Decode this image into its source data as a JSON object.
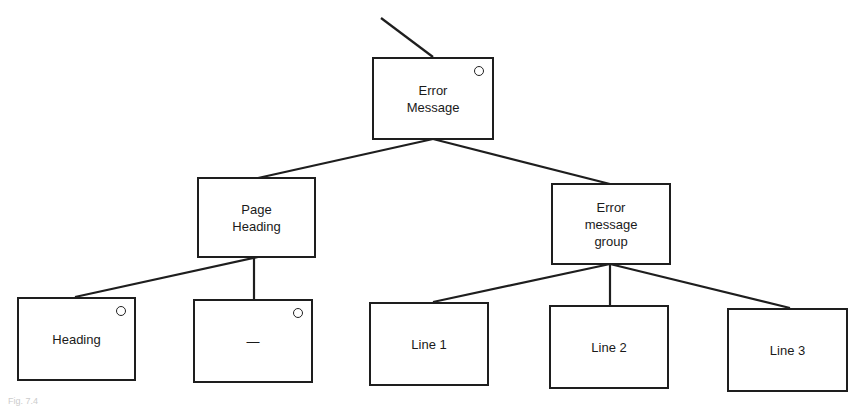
{
  "diagram": {
    "type": "tree",
    "nodes": [
      {
        "id": "error-message",
        "label": "Error\nMessage",
        "marker": true
      },
      {
        "id": "page-heading",
        "label": "Page\nHeading",
        "marker": false
      },
      {
        "id": "error-message-group",
        "label": "Error\nmessage\ngroup",
        "marker": false
      },
      {
        "id": "heading",
        "label": "Heading",
        "marker": true
      },
      {
        "id": "dash",
        "label": "—",
        "marker": true
      },
      {
        "id": "line-1",
        "label": "Line 1",
        "marker": false
      },
      {
        "id": "line-2",
        "label": "Line 2",
        "marker": false
      },
      {
        "id": "line-3",
        "label": "Line 3",
        "marker": false
      }
    ],
    "edges": [
      [
        "error-message",
        "page-heading"
      ],
      [
        "error-message",
        "error-message-group"
      ],
      [
        "page-heading",
        "heading"
      ],
      [
        "page-heading",
        "dash"
      ],
      [
        "error-message-group",
        "line-1"
      ],
      [
        "error-message-group",
        "line-2"
      ],
      [
        "error-message-group",
        "line-3"
      ]
    ],
    "caption": "Fig. 7.4"
  }
}
